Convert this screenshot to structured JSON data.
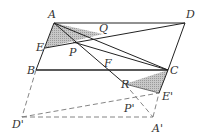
{
  "diagram": {
    "type": "geometry",
    "colors": {
      "line": "#222222",
      "dashed": "#777777",
      "shade": "#b8b8b8",
      "label": "#333333"
    },
    "points": {
      "A": [
        54,
        23
      ],
      "D": [
        185,
        23
      ],
      "B": [
        36,
        70
      ],
      "C": [
        168,
        70
      ],
      "E": [
        45,
        48
      ],
      "Q": [
        103,
        34
      ],
      "P": [
        73,
        42
      ],
      "F": [
        104,
        70
      ],
      "R": [
        125,
        84
      ],
      "E'": [
        159,
        93
      ],
      "P'": [
        139,
        100
      ],
      "D'": [
        22,
        117
      ],
      "A'": [
        153,
        117
      ]
    },
    "labels": [
      {
        "text": "A",
        "x": 48,
        "y": 18
      },
      {
        "text": "D",
        "x": 186,
        "y": 18
      },
      {
        "text": "Q",
        "x": 99,
        "y": 32
      },
      {
        "text": "E",
        "x": 36,
        "y": 51
      },
      {
        "text": "P",
        "x": 69,
        "y": 56
      },
      {
        "text": "F",
        "x": 104,
        "y": 67
      },
      {
        "text": "B",
        "x": 27,
        "y": 74
      },
      {
        "text": "C",
        "x": 170,
        "y": 74
      },
      {
        "text": "R",
        "x": 121,
        "y": 88
      },
      {
        "text": "E'",
        "x": 162,
        "y": 100
      },
      {
        "text": "P'",
        "x": 124,
        "y": 112
      },
      {
        "text": "D'",
        "x": 12,
        "y": 128
      },
      {
        "text": "A'",
        "x": 152,
        "y": 132
      }
    ]
  }
}
